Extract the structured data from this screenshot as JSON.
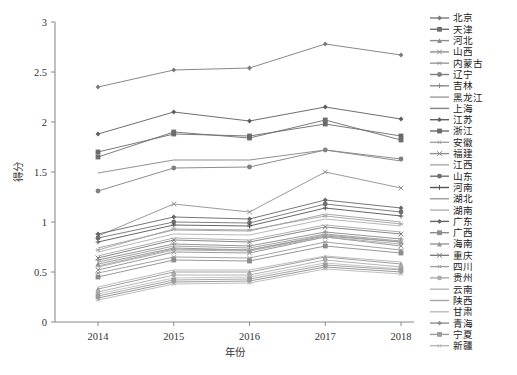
{
  "figure": {
    "caption": "",
    "background": "#ffffff"
  },
  "chart_data": {
    "type": "line",
    "title": "",
    "xlabel": "年份",
    "ylabel": "得分",
    "categories": [
      "2014",
      "2015",
      "2016",
      "2017",
      "2018"
    ],
    "x": [
      2014,
      2015,
      2016,
      2017,
      2018
    ],
    "xlim": [
      2013.6,
      2018.4
    ],
    "ylim": [
      0,
      3
    ],
    "yticks": [
      0,
      0.5,
      1,
      1.5,
      2,
      2.5,
      3
    ],
    "ytick_labels": [
      "0",
      "0.5",
      "1",
      "1.5",
      "2",
      "2.5",
      "3"
    ],
    "grid": false,
    "legend_position": "right",
    "series": [
      {
        "name": "北京",
        "marker": "diamond",
        "color": "#7a7a7a",
        "values": [
          2.35,
          2.52,
          2.54,
          2.78,
          2.67
        ]
      },
      {
        "name": "天津",
        "marker": "square",
        "color": "#6d6d6d",
        "values": [
          1.65,
          1.9,
          1.84,
          2.02,
          1.82
        ]
      },
      {
        "name": "河北",
        "marker": "triangle",
        "color": "#8c8c8c",
        "values": [
          0.58,
          0.74,
          0.72,
          0.86,
          0.8
        ]
      },
      {
        "name": "山西",
        "marker": "x",
        "color": "#909090",
        "values": [
          0.52,
          0.7,
          0.69,
          0.85,
          0.76
        ]
      },
      {
        "name": "内蒙古",
        "marker": "star",
        "color": "#999999",
        "values": [
          0.49,
          0.65,
          0.64,
          0.8,
          0.72
        ]
      },
      {
        "name": "辽宁",
        "marker": "circle",
        "color": "#7f7f7f",
        "values": [
          1.31,
          1.54,
          1.55,
          1.72,
          1.63
        ]
      },
      {
        "name": "吉林",
        "marker": "plus",
        "color": "#8a8a8a",
        "values": [
          0.62,
          0.78,
          0.76,
          0.9,
          0.83
        ]
      },
      {
        "name": "黑龙江",
        "marker": "none",
        "color": "#9a9a9a",
        "values": [
          0.6,
          0.76,
          0.74,
          0.88,
          0.81
        ]
      },
      {
        "name": "上海",
        "marker": "none",
        "color": "#858585",
        "values": [
          1.49,
          1.62,
          1.62,
          1.72,
          1.61
        ]
      },
      {
        "name": "江苏",
        "marker": "diamond",
        "color": "#5e5e5e",
        "values": [
          1.88,
          2.1,
          2.01,
          2.15,
          2.03
        ]
      },
      {
        "name": "浙江",
        "marker": "square",
        "color": "#6a6a6a",
        "values": [
          1.7,
          1.88,
          1.86,
          1.98,
          1.86
        ]
      },
      {
        "name": "安徽",
        "marker": "star",
        "color": "#a3a3a3",
        "values": [
          0.72,
          0.93,
          0.92,
          1.06,
          0.98
        ]
      },
      {
        "name": "福建",
        "marker": "x",
        "color": "#8e8e8e",
        "values": [
          0.86,
          1.18,
          1.1,
          1.5,
          1.34
        ]
      },
      {
        "name": "江西",
        "marker": "none",
        "color": "#a8a8a8",
        "values": [
          0.55,
          0.72,
          0.71,
          0.85,
          0.78
        ]
      },
      {
        "name": "山东",
        "marker": "circle",
        "color": "#707070",
        "values": [
          0.84,
          1.0,
          0.99,
          1.18,
          1.1
        ]
      },
      {
        "name": "河南",
        "marker": "plus",
        "color": "#555555",
        "values": [
          0.8,
          0.97,
          0.96,
          1.14,
          1.06
        ]
      },
      {
        "name": "湖北",
        "marker": "none",
        "color": "#9e9e9e",
        "values": [
          0.74,
          0.92,
          0.91,
          1.08,
          1.0
        ]
      },
      {
        "name": "湖南",
        "marker": "none",
        "color": "#b0b0b0",
        "values": [
          0.7,
          0.88,
          0.87,
          1.03,
          0.96
        ]
      },
      {
        "name": "广东",
        "marker": "diamond",
        "color": "#666666",
        "values": [
          0.88,
          1.05,
          1.03,
          1.22,
          1.14
        ]
      },
      {
        "name": "广西",
        "marker": "square",
        "color": "#8b8b8b",
        "values": [
          0.45,
          0.62,
          0.61,
          0.76,
          0.69
        ]
      },
      {
        "name": "海南",
        "marker": "triangle",
        "color": "#969696",
        "values": [
          0.33,
          0.5,
          0.5,
          0.65,
          0.58
        ]
      },
      {
        "name": "重庆",
        "marker": "x",
        "color": "#7c7c7c",
        "values": [
          0.64,
          0.82,
          0.8,
          0.95,
          0.88
        ]
      },
      {
        "name": "四川",
        "marker": "star",
        "color": "#a0a0a0",
        "values": [
          0.56,
          0.73,
          0.72,
          0.87,
          0.8
        ]
      },
      {
        "name": "贵州",
        "marker": "circle",
        "color": "#ababab",
        "values": [
          0.3,
          0.47,
          0.47,
          0.62,
          0.55
        ]
      },
      {
        "name": "云南",
        "marker": "none",
        "color": "#b4b4b4",
        "values": [
          0.35,
          0.52,
          0.52,
          0.66,
          0.6
        ]
      },
      {
        "name": "陕西",
        "marker": "none",
        "color": "#a6a6a6",
        "values": [
          0.66,
          0.84,
          0.82,
          0.97,
          0.9
        ]
      },
      {
        "name": "甘肃",
        "marker": "none",
        "color": "#bdbdbd",
        "values": [
          0.28,
          0.44,
          0.45,
          0.59,
          0.53
        ]
      },
      {
        "name": "青海",
        "marker": "diamond",
        "color": "#8f8f8f",
        "values": [
          0.24,
          0.4,
          0.41,
          0.55,
          0.5
        ]
      },
      {
        "name": "宁夏",
        "marker": "square",
        "color": "#9c9c9c",
        "values": [
          0.26,
          0.42,
          0.43,
          0.57,
          0.52
        ]
      },
      {
        "name": "新疆",
        "marker": "star",
        "color": "#b8b8b8",
        "values": [
          0.22,
          0.38,
          0.39,
          0.53,
          0.48
        ]
      }
    ]
  }
}
